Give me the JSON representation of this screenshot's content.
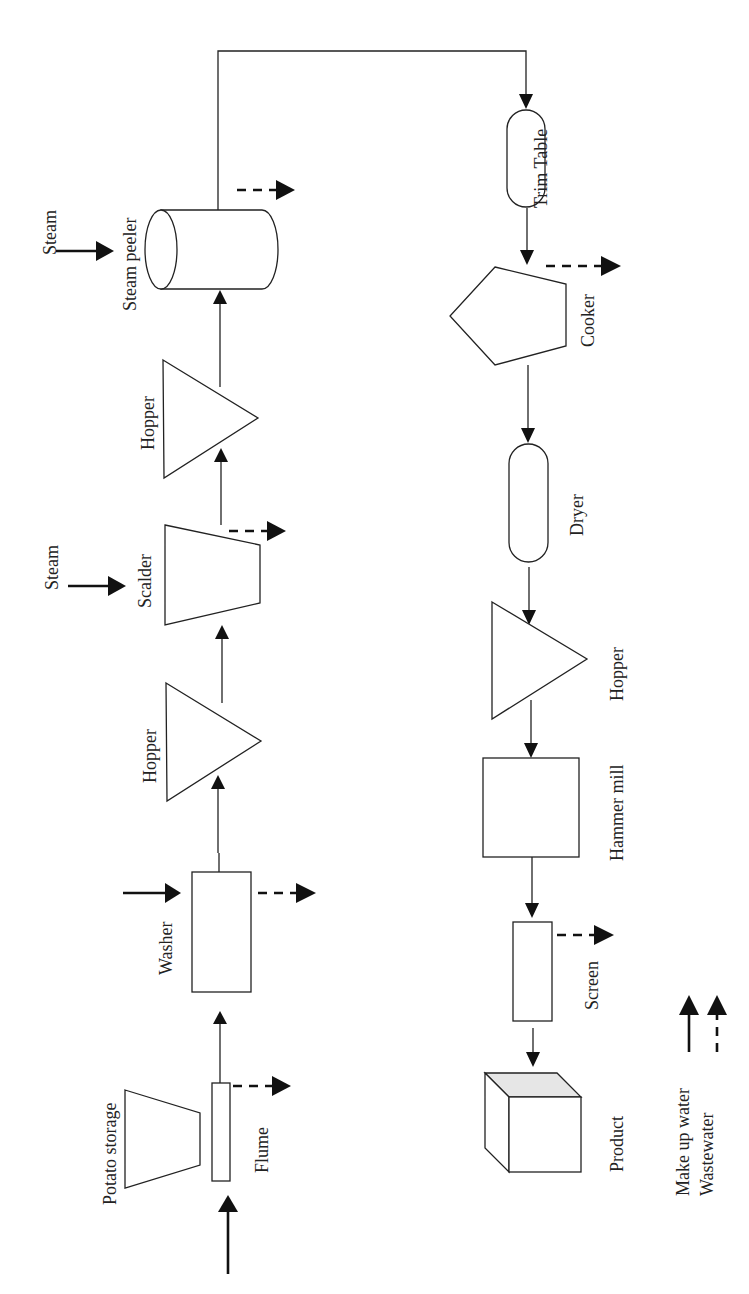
{
  "diagram": {
    "type": "process-flow",
    "orientation": "rotated-90",
    "colors": {
      "stroke": "#222222",
      "background": "#ffffff",
      "product_top": "#e6e6e6"
    },
    "units": {
      "potato_storage": {
        "label": "Potato storage"
      },
      "flume": {
        "label": "Flume"
      },
      "washer": {
        "label": "Washer"
      },
      "hopper_1": {
        "label": "Hopper"
      },
      "scalder": {
        "label": "Scalder"
      },
      "scalder_steam": {
        "label": "Steam"
      },
      "hopper_2": {
        "label": "Hopper"
      },
      "steam_peeler": {
        "label": "Steam peeler"
      },
      "peeler_steam": {
        "label": "Steam"
      },
      "trim_table": {
        "label": "Trim Table"
      },
      "cooker": {
        "label": "Cooker"
      },
      "dryer": {
        "label": "Dryer"
      },
      "hopper_3": {
        "label": "Hopper"
      },
      "hammer_mill": {
        "label": "Hammer mill"
      },
      "screen": {
        "label": "Screen"
      },
      "product": {
        "label": "Product"
      }
    },
    "flow_sequence": [
      "Potato storage",
      "Flume",
      "Washer",
      "Hopper",
      "Scalder",
      "Hopper",
      "Steam peeler",
      "Trim Table",
      "Cooker",
      "Dryer",
      "Hopper",
      "Hammer mill",
      "Screen",
      "Product"
    ],
    "make_up_water_inputs": [
      "Flume",
      "Washer"
    ],
    "steam_inputs": [
      "Scalder",
      "Steam peeler"
    ],
    "wastewater_outputs": [
      "Flume",
      "Washer",
      "Scalder",
      "Steam peeler",
      "Cooker",
      "Screen"
    ],
    "legend": {
      "make_up_water": {
        "label": "Make up water",
        "style": "solid"
      },
      "wastewater": {
        "label": "Wastewater",
        "style": "dashed"
      }
    }
  }
}
